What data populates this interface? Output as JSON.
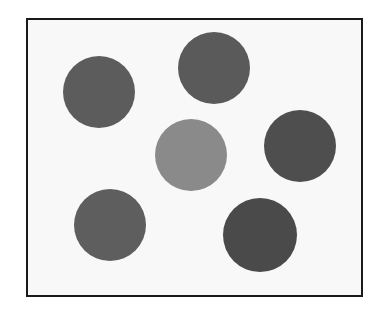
{
  "figure": {
    "frame": {
      "left": 26,
      "top": 18,
      "width": 333,
      "height": 275,
      "border_color": "#1a1a1a",
      "background": "#f8f8f8"
    },
    "circles": [
      {
        "id": "circle-top-left",
        "cx": 99,
        "cy": 92,
        "r": 36,
        "color": "#5c5c5c"
      },
      {
        "id": "circle-top-center",
        "cx": 214,
        "cy": 68,
        "r": 36,
        "color": "#5a5a5a"
      },
      {
        "id": "circle-center",
        "cx": 191,
        "cy": 155,
        "r": 36,
        "color": "#8a8a8a"
      },
      {
        "id": "circle-right",
        "cx": 300,
        "cy": 146,
        "r": 36,
        "color": "#4e4e4e"
      },
      {
        "id": "circle-bottom-left",
        "cx": 110,
        "cy": 225,
        "r": 36,
        "color": "#5e5e5e"
      },
      {
        "id": "circle-bottom-right",
        "cx": 260,
        "cy": 235,
        "r": 37,
        "color": "#4a4a4a"
      }
    ]
  }
}
